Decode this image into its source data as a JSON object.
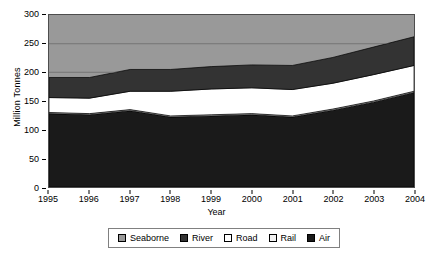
{
  "chart_data": {
    "type": "area",
    "title": "",
    "xlabel": "Year",
    "ylabel": "Million Tonnes",
    "categories": [
      "1995",
      "1996",
      "1997",
      "1998",
      "1999",
      "2000",
      "2001",
      "2002",
      "2003",
      "2004"
    ],
    "x": [
      1995,
      1996,
      1997,
      1998,
      1999,
      2000,
      2001,
      2002,
      2003,
      2004
    ],
    "xlim": [
      1995,
      2004
    ],
    "ylim": [
      0,
      300
    ],
    "yticks": [
      0,
      50,
      100,
      150,
      200,
      250,
      300
    ],
    "grid": true,
    "legend_position": "bottom",
    "stacked": true,
    "stack_order_bottom_to_top": [
      "Air",
      "Rail",
      "Road",
      "River",
      "Seaborne"
    ],
    "series": [
      {
        "name": "Air",
        "color": "#1a1a1a",
        "values": [
          128,
          126,
          133,
          122,
          124,
          126,
          122,
          134,
          148,
          165
        ]
      },
      {
        "name": "Rail",
        "color": "#f2f2f2",
        "values": [
          2,
          2,
          2,
          2,
          2,
          2,
          2,
          2,
          2,
          2
        ]
      },
      {
        "name": "Road",
        "color": "#ffffff",
        "values": [
          26,
          27,
          32,
          43,
          45,
          45,
          46,
          45,
          46,
          45
        ]
      },
      {
        "name": "River",
        "color": "#333333",
        "values": [
          35,
          36,
          38,
          38,
          39,
          40,
          42,
          45,
          48,
          50
        ]
      },
      {
        "name": "Seaborne",
        "color": "#999999",
        "values": [
          0,
          0,
          0,
          0,
          0,
          0,
          0,
          0,
          0,
          0
        ]
      }
    ],
    "cumulative_totals": [
      191,
      191,
      205,
      205,
      210,
      213,
      212,
      226,
      244,
      262
    ],
    "band_boundaries": {
      "air_top": [
        128,
        126,
        133,
        122,
        124,
        126,
        122,
        134,
        148,
        165
      ],
      "rail_top": [
        130,
        128,
        135,
        124,
        126,
        128,
        124,
        136,
        150,
        167
      ],
      "road_top": [
        156,
        155,
        167,
        167,
        171,
        173,
        170,
        181,
        196,
        212
      ],
      "river_top": [
        191,
        191,
        205,
        205,
        210,
        213,
        212,
        226,
        244,
        262
      ]
    }
  },
  "axes": {
    "y_tick_labels": [
      "300",
      "250",
      "200",
      "150",
      "100",
      "50",
      "0"
    ],
    "x_tick_labels": [
      "1995",
      "1996",
      "1997",
      "1998",
      "1999",
      "2000",
      "2001",
      "2002",
      "2003",
      "2004"
    ],
    "y_axis_title": "Million Tonnes",
    "x_axis_title": "Year"
  },
  "legend": {
    "items": [
      {
        "label": "Seaborne",
        "color": "#999999"
      },
      {
        "label": "River",
        "color": "#333333"
      },
      {
        "label": "Road",
        "color": "#ffffff"
      },
      {
        "label": "Rail",
        "color": "#f2f2f2"
      },
      {
        "label": "Air",
        "color": "#1a1a1a"
      }
    ]
  },
  "colors": {
    "plot_background": "#999999",
    "frame": "#4d4d4d",
    "gridline": "#808080",
    "text": "#000000",
    "page_background": "#ffffff"
  }
}
